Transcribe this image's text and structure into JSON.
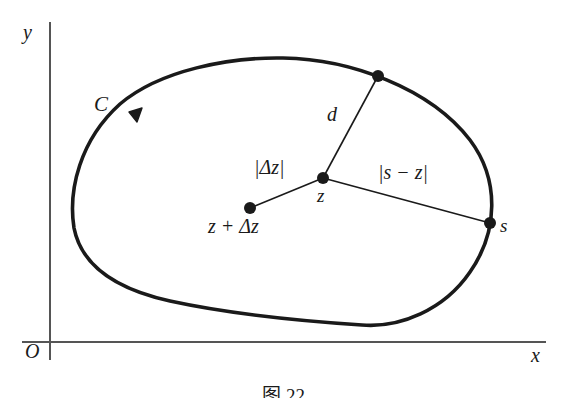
{
  "figure": {
    "type": "complex-plane-contour-diagram",
    "background_color": "#ffffff",
    "ink_color": "#1a1a1a",
    "axis_color": "#555555",
    "axes": {
      "y_label": "y",
      "x_label": "x",
      "origin_label": "O"
    },
    "contour": {
      "label": "C",
      "orientation": "clockwise",
      "arrow_name": "direction-arrow"
    },
    "points": [
      {
        "name": "z",
        "label": "z"
      },
      {
        "name": "z-plus-delta-z",
        "label": "z + Δz"
      },
      {
        "name": "s",
        "label": "s"
      },
      {
        "name": "nearest-contour-point",
        "label": ""
      }
    ],
    "segments": [
      {
        "name": "delta-z-segment",
        "label": "|Δz|"
      },
      {
        "name": "d-segment",
        "label": "d"
      },
      {
        "name": "s-minus-z-segment",
        "label": "|s − z|"
      }
    ],
    "caption": "图 22"
  }
}
